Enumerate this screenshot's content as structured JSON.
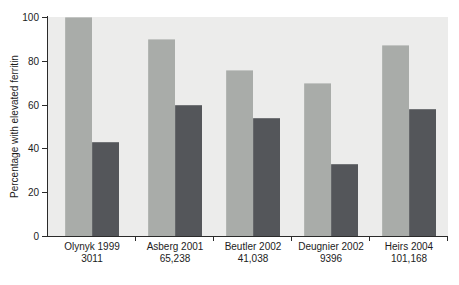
{
  "figure": {
    "kind": "grouped-bar-chart",
    "background": "#ffffff"
  },
  "chart_data": {
    "type": "bar",
    "title": "",
    "xlabel": "",
    "ylabel": "Percentage with elevated ferritin",
    "ylim": [
      0,
      100
    ],
    "yticks": [
      0,
      20,
      40,
      60,
      80,
      100
    ],
    "grid": false,
    "legend": "none",
    "categories": [
      "Olynyk 1999",
      "Asberg 2001",
      "Beutler 2002",
      "Deugnier 2002",
      "Heirs 2004"
    ],
    "sample_sizes": [
      "3011",
      "65,238",
      "41,038",
      "9396",
      "101,168"
    ],
    "series": [
      {
        "name": "light-gray",
        "color": "#a9aca9",
        "values": [
          100,
          90,
          76,
          70,
          87
        ]
      },
      {
        "name": "dark-gray",
        "color": "#54565a",
        "values": [
          43,
          60,
          54,
          33,
          58
        ]
      }
    ],
    "colors": {
      "plot_background": "#ececeb",
      "axis": "#2a2a2a",
      "text": "#1c1c1c"
    }
  }
}
